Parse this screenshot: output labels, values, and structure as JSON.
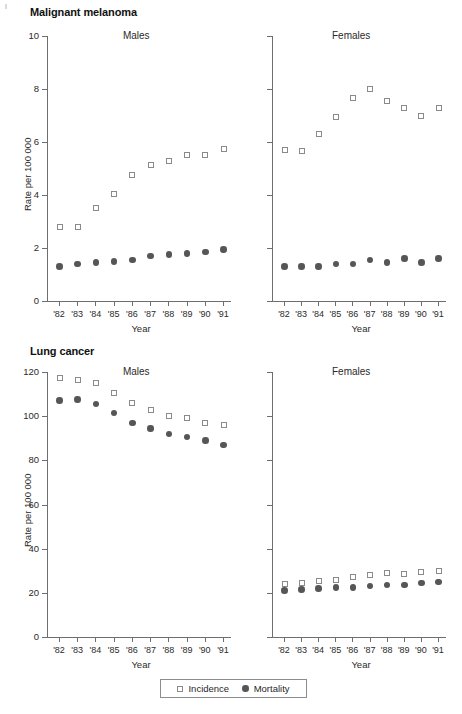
{
  "figure": {
    "width": 462,
    "height": 714,
    "background": "#ffffff",
    "marker_colors": {
      "incidence_stroke": "#8a8a8a",
      "incidence_fill": "#ffffff",
      "mortality_fill": "#565656",
      "axis": "#6e6e6e"
    }
  },
  "legend": {
    "entries": [
      {
        "label": "Incidence",
        "marker": "open-square-icon"
      },
      {
        "label": "Mortality",
        "marker": "filled-circle-icon"
      }
    ]
  },
  "chart_data": [
    {
      "type": "scatter",
      "title": "Malignant melanoma",
      "panel": "Males",
      "xlabel": "Year",
      "ylabel": "Rate per 100 000",
      "categories": [
        "'82",
        "'83",
        "'84",
        "'85",
        "'86",
        "'87",
        "'88",
        "'89",
        "'90",
        "'91"
      ],
      "ylim": [
        0,
        10
      ],
      "yticks": [
        0,
        2,
        4,
        6,
        8,
        10
      ],
      "ytick_labels": [
        "0",
        "2",
        "4",
        "6",
        "8",
        "10"
      ],
      "grid": false,
      "legend_position": "bottom",
      "series": [
        {
          "name": "Incidence",
          "values": [
            2.8,
            2.8,
            3.5,
            4.05,
            4.75,
            5.15,
            5.3,
            5.5,
            5.5,
            5.75
          ]
        },
        {
          "name": "Mortality",
          "values": [
            1.3,
            1.4,
            1.45,
            1.5,
            1.55,
            1.7,
            1.75,
            1.8,
            1.85,
            1.95
          ]
        }
      ]
    },
    {
      "type": "scatter",
      "title": "Malignant melanoma",
      "panel": "Females",
      "xlabel": "Year",
      "ylabel": "",
      "categories": [
        "'82",
        "'83",
        "'84",
        "'85",
        "'86",
        "'87",
        "'88",
        "'89",
        "'90",
        "'91"
      ],
      "ylim": [
        0,
        10
      ],
      "yticks": [
        0,
        2,
        4,
        6,
        8,
        10
      ],
      "ytick_labels": [
        "",
        "",
        "",
        "",
        "",
        ""
      ],
      "grid": false,
      "legend_position": "bottom",
      "series": [
        {
          "name": "Incidence",
          "values": [
            5.7,
            5.65,
            6.3,
            6.95,
            7.65,
            8.0,
            7.55,
            7.3,
            7.0,
            7.3
          ]
        },
        {
          "name": "Mortality",
          "values": [
            1.3,
            1.3,
            1.3,
            1.4,
            1.4,
            1.55,
            1.45,
            1.6,
            1.45,
            1.6
          ]
        }
      ]
    },
    {
      "type": "scatter",
      "title": "Lung cancer",
      "panel": "Males",
      "xlabel": "Year",
      "ylabel": "Rate per 100 000",
      "categories": [
        "'82",
        "'83",
        "'84",
        "'85",
        "'86",
        "'87",
        "'88",
        "'89",
        "'90",
        "'91"
      ],
      "ylim": [
        0,
        120
      ],
      "yticks": [
        0,
        20,
        40,
        60,
        80,
        100,
        120
      ],
      "ytick_labels": [
        "0",
        "20",
        "40",
        "60",
        "80",
        "100",
        "120"
      ],
      "grid": false,
      "legend_position": "bottom",
      "series": [
        {
          "name": "Incidence",
          "values": [
            117.5,
            116.5,
            115.0,
            110.5,
            106.0,
            103.0,
            100.0,
            99.0,
            97.0,
            96.0
          ]
        },
        {
          "name": "Mortality",
          "values": [
            107.0,
            107.5,
            105.5,
            101.5,
            97.0,
            94.5,
            92.0,
            90.5,
            89.0,
            87.0
          ]
        }
      ]
    },
    {
      "type": "scatter",
      "title": "Lung cancer",
      "panel": "Females",
      "xlabel": "Year",
      "ylabel": "",
      "categories": [
        "'82",
        "'83",
        "'84",
        "'85",
        "'86",
        "'87",
        "'88",
        "'89",
        "'90",
        "'91"
      ],
      "ylim": [
        0,
        120
      ],
      "yticks": [
        0,
        20,
        40,
        60,
        80,
        100,
        120
      ],
      "ytick_labels": [
        "",
        "",
        "",
        "",
        "",
        "",
        ""
      ],
      "grid": false,
      "legend_position": "bottom",
      "series": [
        {
          "name": "Incidence",
          "values": [
            24.0,
            24.5,
            25.5,
            26.0,
            27.0,
            28.0,
            29.0,
            28.5,
            29.5,
            30.0
          ]
        },
        {
          "name": "Mortality",
          "values": [
            21.0,
            21.5,
            22.0,
            22.5,
            22.5,
            23.0,
            23.5,
            23.5,
            24.5,
            25.0
          ]
        }
      ]
    }
  ]
}
